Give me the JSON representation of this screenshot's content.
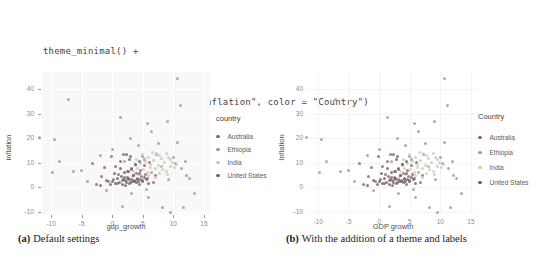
{
  "code_block": {
    "lines": [
      "theme_minimal() +",
      "labs(x = \"GDP growth\", y = \"Inflation\", color = \"Country\")"
    ]
  },
  "captions": {
    "a_tag": "(a)",
    "a_text": "Default settings",
    "b_tag": "(b)",
    "b_text": "With the addition of a theme and labels"
  },
  "palette": {
    "australia": "#9a625a",
    "ethiopia": "#96a089",
    "india": "#c4cdbb",
    "united_states": "#6b6370"
  },
  "chart_data": {
    "type": "scatter",
    "shared": {
      "categories": [
        "Australia",
        "Ethiopia",
        "India",
        "United States"
      ],
      "points": [
        [
          -3.2,
          9.8,
          0
        ],
        [
          -2.5,
          1.2,
          0
        ],
        [
          -1.8,
          4.5,
          0
        ],
        [
          -1.2,
          7.9,
          0
        ],
        [
          -0.6,
          2.2,
          0
        ],
        [
          0.2,
          3.1,
          0
        ],
        [
          0.5,
          8.2,
          0
        ],
        [
          0.8,
          1.5,
          0
        ],
        [
          1.1,
          5.3,
          0
        ],
        [
          1.4,
          10.6,
          0
        ],
        [
          1.7,
          2.8,
          0
        ],
        [
          2.0,
          4.1,
          0
        ],
        [
          2.2,
          0.8,
          0
        ],
        [
          2.5,
          6.4,
          0
        ],
        [
          2.7,
          3.5,
          0
        ],
        [
          3.0,
          1.9,
          0
        ],
        [
          3.2,
          7.1,
          0
        ],
        [
          3.4,
          4.8,
          0
        ],
        [
          3.6,
          2.4,
          0
        ],
        [
          3.8,
          9.2,
          0
        ],
        [
          4.0,
          5.6,
          0
        ],
        [
          4.2,
          3.0,
          0
        ],
        [
          4.4,
          1.1,
          0
        ],
        [
          4.6,
          6.8,
          0
        ],
        [
          4.8,
          4.2,
          0
        ],
        [
          5.0,
          2.6,
          0
        ],
        [
          5.2,
          8.8,
          0
        ],
        [
          5.5,
          5.0,
          0
        ],
        [
          5.8,
          3.3,
          0
        ],
        [
          6.1,
          10.2,
          0
        ],
        [
          6.4,
          6.1,
          0
        ],
        [
          6.7,
          2.0,
          0
        ],
        [
          7.0,
          4.6,
          0
        ],
        [
          -0.2,
          12.5,
          0
        ],
        [
          1.9,
          13.2,
          0
        ],
        [
          5.3,
          11.4,
          0
        ],
        [
          10.7,
          44.5,
          1
        ],
        [
          -7.1,
          35.8,
          1
        ],
        [
          11.2,
          33.2,
          1
        ],
        [
          1.3,
          28.6,
          1
        ],
        [
          5.8,
          26.0,
          1
        ],
        [
          9.0,
          26.8,
          1
        ],
        [
          6.5,
          22.9,
          1
        ],
        [
          -11.9,
          20.3,
          1
        ],
        [
          -9.4,
          19.6,
          1
        ],
        [
          -8.7,
          10.6,
          1
        ],
        [
          -6.3,
          6.4,
          1
        ],
        [
          -5.0,
          6.6,
          1
        ],
        [
          1.6,
          -7.8,
          1
        ],
        [
          8.3,
          -8.4,
          1
        ],
        [
          9.6,
          -10.3,
          1
        ],
        [
          11.7,
          -8.4,
          1
        ],
        [
          13.5,
          -2.6,
          1
        ],
        [
          12.6,
          3.5,
          1
        ],
        [
          12.2,
          4.6,
          1
        ],
        [
          10.6,
          18.3,
          1
        ],
        [
          7.5,
          17.6,
          1
        ],
        [
          3.0,
          19.8,
          1
        ],
        [
          2.0,
          10.3,
          1
        ],
        [
          5.0,
          12.4,
          1
        ],
        [
          0.0,
          15.2,
          1
        ],
        [
          -2.0,
          13.0,
          1
        ],
        [
          -4.0,
          2.1,
          1
        ],
        [
          -1.0,
          -1.2,
          1
        ],
        [
          3.2,
          -2.8,
          1
        ],
        [
          6.0,
          -4.1,
          1
        ],
        [
          4.3,
          16.8,
          1
        ],
        [
          7.2,
          13.3,
          1
        ],
        [
          10.0,
          12.1,
          1
        ],
        [
          11.4,
          7.6,
          1
        ],
        [
          12.0,
          10.4,
          1
        ],
        [
          10.4,
          9.7,
          1
        ],
        [
          8.0,
          8.2,
          1
        ],
        [
          9.2,
          3.1,
          1
        ],
        [
          5.6,
          -0.9,
          1
        ],
        [
          -9.8,
          6.1,
          1
        ],
        [
          3.5,
          6.5,
          2
        ],
        [
          3.8,
          8.9,
          2
        ],
        [
          4.0,
          11.2,
          2
        ],
        [
          4.3,
          5.2,
          2
        ],
        [
          4.6,
          9.6,
          2
        ],
        [
          4.9,
          13.1,
          2
        ],
        [
          5.1,
          7.0,
          2
        ],
        [
          5.4,
          10.4,
          2
        ],
        [
          5.7,
          5.8,
          2
        ],
        [
          6.0,
          12.2,
          2
        ],
        [
          6.2,
          8.1,
          2
        ],
        [
          6.5,
          6.0,
          2
        ],
        [
          6.8,
          10.9,
          2
        ],
        [
          7.0,
          7.6,
          2
        ],
        [
          7.3,
          13.6,
          2
        ],
        [
          7.5,
          9.0,
          2
        ],
        [
          7.8,
          5.5,
          2
        ],
        [
          8.0,
          11.6,
          2
        ],
        [
          8.3,
          7.2,
          2
        ],
        [
          8.6,
          9.9,
          2
        ],
        [
          8.9,
          6.3,
          2
        ],
        [
          9.2,
          12.0,
          2
        ],
        [
          9.5,
          8.5,
          2
        ],
        [
          9.8,
          10.1,
          2
        ],
        [
          10.2,
          7.8,
          2
        ],
        [
          3.3,
          4.2,
          2
        ],
        [
          5.9,
          4.6,
          2
        ],
        [
          7.1,
          4.0,
          2
        ],
        [
          4.1,
          7.7,
          2
        ],
        [
          6.3,
          9.3,
          2
        ],
        [
          8.1,
          8.4,
          2
        ],
        [
          9.0,
          5.1,
          2
        ],
        [
          5.2,
          11.8,
          2
        ],
        [
          6.6,
          14.2,
          2
        ],
        [
          7.7,
          12.8,
          2
        ],
        [
          8.8,
          13.9,
          2
        ],
        [
          9.6,
          11.1,
          2
        ],
        [
          10.5,
          9.4,
          2
        ],
        [
          -0.3,
          0.9,
          3
        ],
        [
          0.1,
          2.3,
          3
        ],
        [
          0.6,
          1.6,
          3
        ],
        [
          0.9,
          3.4,
          3
        ],
        [
          1.2,
          2.0,
          3
        ],
        [
          1.5,
          4.3,
          3
        ],
        [
          1.7,
          1.2,
          3
        ],
        [
          1.9,
          3.0,
          3
        ],
        [
          2.1,
          2.5,
          3
        ],
        [
          2.3,
          1.8,
          3
        ],
        [
          2.5,
          3.8,
          3
        ],
        [
          2.7,
          2.9,
          3
        ],
        [
          2.9,
          1.4,
          3
        ],
        [
          3.1,
          3.2,
          3
        ],
        [
          3.3,
          2.2,
          3
        ],
        [
          3.5,
          4.6,
          3
        ],
        [
          3.7,
          2.7,
          3
        ],
        [
          3.9,
          1.7,
          3
        ],
        [
          4.1,
          3.5,
          3
        ],
        [
          4.3,
          2.4,
          3
        ],
        [
          4.5,
          5.4,
          3
        ],
        [
          4.7,
          3.1,
          3
        ],
        [
          5.0,
          2.1,
          3
        ],
        [
          5.3,
          4.1,
          3
        ],
        [
          5.6,
          3.0,
          3
        ],
        [
          2.0,
          5.8,
          3
        ],
        [
          2.6,
          6.2,
          3
        ],
        [
          3.2,
          7.6,
          3
        ],
        [
          3.8,
          9.1,
          3
        ],
        [
          4.4,
          10.3,
          3
        ],
        [
          -1.0,
          2.8,
          3
        ],
        [
          -1.9,
          0.5,
          3
        ],
        [
          0.4,
          5.5,
          3
        ],
        [
          1.3,
          7.4,
          3
        ],
        [
          2.8,
          11.1,
          3
        ],
        [
          5.9,
          1.5,
          3
        ],
        [
          2.4,
          13.5,
          3
        ],
        [
          3.0,
          12.3,
          3
        ]
      ]
    },
    "charts": [
      {
        "id": "a",
        "type": "scatter",
        "xlabel": "gdp_growth",
        "ylabel": "inflation",
        "legend_title": "country",
        "legend_entries": [
          "Australia",
          "Ethiopia",
          "India",
          "United States"
        ],
        "x_ticks": [
          -10,
          -5,
          0,
          5,
          10,
          15
        ],
        "y_ticks": [
          40,
          30,
          20,
          10,
          0,
          -10
        ],
        "xlim": [
          -11.5,
          16
        ],
        "ylim": [
          -11,
          47
        ],
        "grid": true,
        "legend_position": "right",
        "show_tick_marks": true,
        "panel_left": 42
      },
      {
        "id": "b",
        "type": "scatter",
        "xlabel": "GDP growth",
        "ylabel": "Inflation",
        "legend_title": "Country",
        "legend_entries": [
          "Australia",
          "Ethiopia",
          "India",
          "United States"
        ],
        "x_ticks": [
          -10,
          -5,
          0,
          5,
          10,
          15
        ],
        "y_ticks": [
          40,
          30,
          20,
          10,
          0,
          -10
        ],
        "xlim": [
          -11.5,
          16
        ],
        "ylim": [
          -11,
          47
        ],
        "grid": true,
        "legend_position": "right",
        "show_tick_marks": false,
        "panel_left": 36
      }
    ]
  }
}
